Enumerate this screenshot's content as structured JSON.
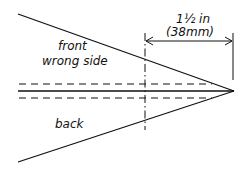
{
  "diagram": {
    "labels": {
      "front": "front",
      "wrong_side": "wrong side",
      "back": "back",
      "dimension_imperial": "1½ in",
      "dimension_metric": "(38mm)"
    },
    "colors": {
      "line": "#111111",
      "background": "#ffffff"
    }
  }
}
